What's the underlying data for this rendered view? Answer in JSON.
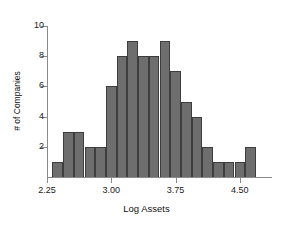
{
  "chart_data": {
    "type": "bar",
    "title": "",
    "subtitle": "",
    "xlabel": "Log Assets",
    "ylabel": "# of Companies",
    "bar_color": "#6e6e6e",
    "bar_edge_color": "#3d3d3d",
    "axis_color": "#8a8a8a",
    "grid": false,
    "legend": false,
    "xlim": [
      2.25,
      4.875
    ],
    "ylim": [
      0,
      10
    ],
    "x_ticks": [
      2.25,
      3.0,
      3.75,
      4.5
    ],
    "x_tick_labels": [
      "2.25",
      "3.00",
      "3.75",
      "4.50"
    ],
    "y_ticks": [
      2,
      4,
      6,
      8,
      10
    ],
    "y_tick_labels": [
      "2",
      "4",
      "6",
      "8",
      "10"
    ],
    "bin_width": 0.125,
    "bin_edges": [
      2.3125,
      2.4375,
      2.5625,
      2.6875,
      2.8125,
      2.9375,
      3.0625,
      3.1875,
      3.3125,
      3.4375,
      3.5625,
      3.6875,
      3.8125,
      3.9375,
      4.0625,
      4.1875,
      4.3125,
      4.4375,
      4.5625,
      4.6875,
      4.8125
    ],
    "bin_centers": [
      2.375,
      2.5,
      2.625,
      2.75,
      2.875,
      3.0,
      3.125,
      3.25,
      3.375,
      3.5,
      3.625,
      3.75,
      3.875,
      4.0,
      4.125,
      4.25,
      4.375,
      4.5,
      4.625,
      4.75
    ],
    "values": [
      1,
      3,
      3,
      2,
      2,
      6,
      8,
      9,
      8,
      8,
      9,
      7,
      5,
      4,
      2,
      1,
      1,
      1,
      2,
      0
    ],
    "categories": [
      "2.375",
      "2.5",
      "2.625",
      "2.75",
      "2.875",
      "3.0",
      "3.125",
      "3.25",
      "3.375",
      "3.5",
      "3.625",
      "3.75",
      "3.875",
      "4.0",
      "4.125",
      "4.25",
      "4.375",
      "4.5",
      "4.625",
      "4.75"
    ]
  }
}
